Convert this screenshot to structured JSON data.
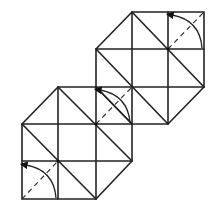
{
  "diagram": {
    "type": "origami crease pattern",
    "colors": {
      "line": "#222222",
      "background": "#ffffff"
    },
    "tiles": [
      {
        "name": "upper-right-tile",
        "x0": 96,
        "y0": 12,
        "cell": 36
      },
      {
        "name": "lower-left-tile",
        "x0": 22,
        "y0": 87,
        "cell": 36.5
      }
    ],
    "fold_arrows": [
      {
        "name": "fold-arrow-top-right",
        "cell": [
          168,
          12,
          204,
          49
        ]
      },
      {
        "name": "fold-arrow-middle",
        "cell": [
          96,
          87,
          132,
          124
        ]
      },
      {
        "name": "fold-arrow-bottom-left",
        "cell": [
          22,
          161,
          58,
          199
        ]
      }
    ]
  }
}
